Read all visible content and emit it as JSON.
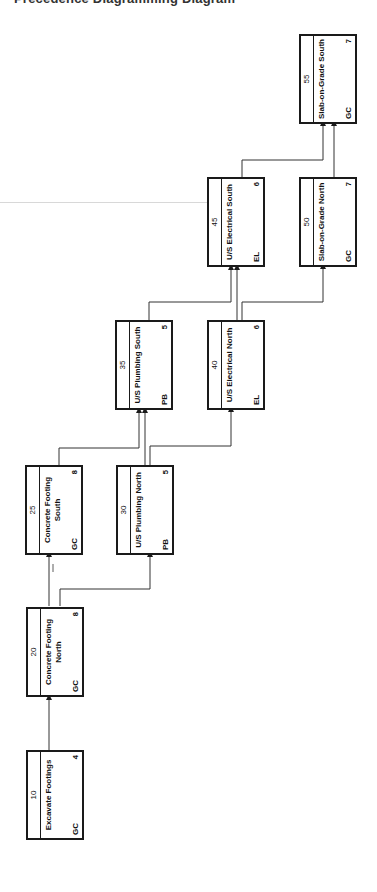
{
  "title_fragment": "Precedence Diagramming Diagram",
  "activities": [
    {
      "id": "10",
      "name": "Excavate Footings",
      "resource": "GC",
      "duration": "4"
    },
    {
      "id": "20",
      "name": "Concrete Footing North",
      "resource": "GC",
      "duration": "8"
    },
    {
      "id": "25",
      "name": "Concrete Footing South",
      "resource": "GC",
      "duration": "8"
    },
    {
      "id": "30",
      "name": "U/S Plumbing North",
      "resource": "PB",
      "duration": "5"
    },
    {
      "id": "35",
      "name": "U/S Plumbing South",
      "resource": "PB",
      "duration": "5"
    },
    {
      "id": "40",
      "name": "U/S Electrical North",
      "resource": "EL",
      "duration": "6"
    },
    {
      "id": "45",
      "name": "U/S Electrical South",
      "resource": "EL",
      "duration": "6"
    },
    {
      "id": "50",
      "name": "Slab-on-Grade North",
      "resource": "GC",
      "duration": "7"
    },
    {
      "id": "55",
      "name": "Slab-on-Grade South",
      "resource": "GC",
      "duration": "7"
    }
  ],
  "links": [
    {
      "from": "10",
      "to": "20"
    },
    {
      "from": "20",
      "to": "25"
    },
    {
      "from": "20",
      "to": "30"
    },
    {
      "from": "25",
      "to": "35"
    },
    {
      "from": "30",
      "to": "35"
    },
    {
      "from": "30",
      "to": "40"
    },
    {
      "from": "35",
      "to": "45"
    },
    {
      "from": "40",
      "to": "45"
    },
    {
      "from": "40",
      "to": "50"
    },
    {
      "from": "45",
      "to": "55"
    },
    {
      "from": "50",
      "to": "55"
    }
  ]
}
